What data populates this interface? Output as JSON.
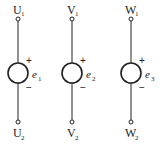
{
  "diagram": {
    "title": "",
    "type": "three independent voltage sources (three-phase windings)",
    "sources": [
      {
        "id": "phase-u",
        "x": 18,
        "top_terminal": {
          "letter": "U",
          "subscript": "1"
        },
        "bottom_terminal": {
          "letter": "U",
          "subscript": "2"
        },
        "emf": {
          "symbol": "e",
          "subscript": "1"
        },
        "plus": "+",
        "minus": "−"
      },
      {
        "id": "phase-v",
        "x": 72,
        "top_terminal": {
          "letter": "V",
          "subscript": "1"
        },
        "bottom_terminal": {
          "letter": "V",
          "subscript": "2"
        },
        "emf": {
          "symbol": "e",
          "subscript": "2"
        },
        "plus": "+",
        "minus": "−"
      },
      {
        "id": "phase-w",
        "x": 131,
        "top_terminal": {
          "letter": "W",
          "subscript": "1"
        },
        "bottom_terminal": {
          "letter": "W",
          "subscript": "2"
        },
        "emf": {
          "symbol": "e",
          "subscript": "3"
        },
        "plus": "+",
        "minus": "−"
      }
    ],
    "colors": {
      "stroke": "#222222",
      "background": "#ffffff"
    }
  }
}
